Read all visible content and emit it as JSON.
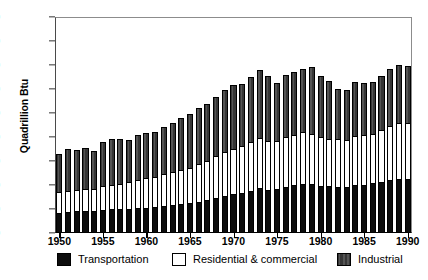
{
  "chart_data": {
    "type": "bar",
    "stacked": true,
    "title": "",
    "xlabel": "",
    "ylabel": "Quadrillion Btu",
    "ylim": [
      0,
      90
    ],
    "yticks": [
      0,
      10,
      20,
      30,
      40,
      50,
      60,
      70,
      80,
      90
    ],
    "xticks": [
      1950,
      1955,
      1960,
      1965,
      1970,
      1975,
      1980,
      1985,
      1990
    ],
    "grid": false,
    "legend_position": "bottom",
    "categories": [
      1950,
      1951,
      1952,
      1953,
      1954,
      1955,
      1956,
      1957,
      1958,
      1959,
      1960,
      1961,
      1962,
      1963,
      1964,
      1965,
      1966,
      1967,
      1968,
      1969,
      1970,
      1971,
      1972,
      1973,
      1974,
      1975,
      1976,
      1977,
      1978,
      1979,
      1980,
      1981,
      1982,
      1983,
      1984,
      1985,
      1986,
      1987,
      1988,
      1989,
      1990
    ],
    "series": [
      {
        "name": "Transportation",
        "color": "#0d0d0d",
        "values": [
          8.5,
          8.9,
          9.0,
          9.2,
          9.0,
          9.5,
          9.8,
          9.9,
          10.0,
          10.4,
          10.6,
          10.7,
          11.2,
          11.6,
          12.0,
          12.4,
          13.1,
          13.7,
          14.6,
          15.3,
          16.1,
          16.8,
          17.7,
          18.6,
          18.1,
          18.2,
          19.1,
          19.8,
          20.6,
          20.5,
          19.7,
          19.5,
          19.1,
          19.1,
          19.8,
          20.1,
          20.7,
          21.4,
          22.2,
          22.5,
          22.5
        ]
      },
      {
        "name": "Residential & commercial",
        "color": "#ffffff",
        "values": [
          8.6,
          8.8,
          8.9,
          9.1,
          9.3,
          9.9,
          10.4,
          10.5,
          11.2,
          11.8,
          12.4,
          12.7,
          13.4,
          13.8,
          14.2,
          14.8,
          15.6,
          16.5,
          17.3,
          18.3,
          19.0,
          19.4,
          20.3,
          20.8,
          20.2,
          20.1,
          20.8,
          21.1,
          21.4,
          20.9,
          20.4,
          19.6,
          19.9,
          19.8,
          20.5,
          20.6,
          20.6,
          21.4,
          22.4,
          23.4,
          23.2
        ]
      },
      {
        "name": "Industrial",
        "color": "#3c3c3c",
        "values": [
          15.9,
          17.3,
          16.8,
          17.3,
          16.0,
          18.6,
          19.1,
          18.8,
          17.4,
          18.5,
          18.6,
          18.5,
          19.4,
          20.5,
          21.6,
          22.4,
          23.6,
          23.6,
          24.7,
          25.8,
          26.4,
          25.8,
          27.1,
          28.6,
          27.2,
          24.3,
          26.1,
          26.1,
          26.5,
          27.6,
          25.2,
          24.1,
          21.1,
          20.6,
          22.5,
          22.0,
          21.6,
          22.6,
          23.7,
          24.3,
          24.0
        ]
      }
    ]
  },
  "legend": {
    "items": [
      {
        "label": "Transportation",
        "swatch": "solid-black-swatch"
      },
      {
        "label": "Residential & commercial",
        "swatch": "open-white-swatch"
      },
      {
        "label": "Industrial",
        "swatch": "dark-hatched-swatch"
      }
    ]
  },
  "axis": {
    "y_title": "Quadrillion Btu",
    "y_tick_labels": [
      "0",
      "10",
      "20",
      "30",
      "40",
      "50",
      "60",
      "70",
      "80",
      "90"
    ],
    "x_tick_labels": [
      "1950",
      "1955",
      "1960",
      "1965",
      "1970",
      "1975",
      "1980",
      "1985",
      "1990"
    ]
  }
}
